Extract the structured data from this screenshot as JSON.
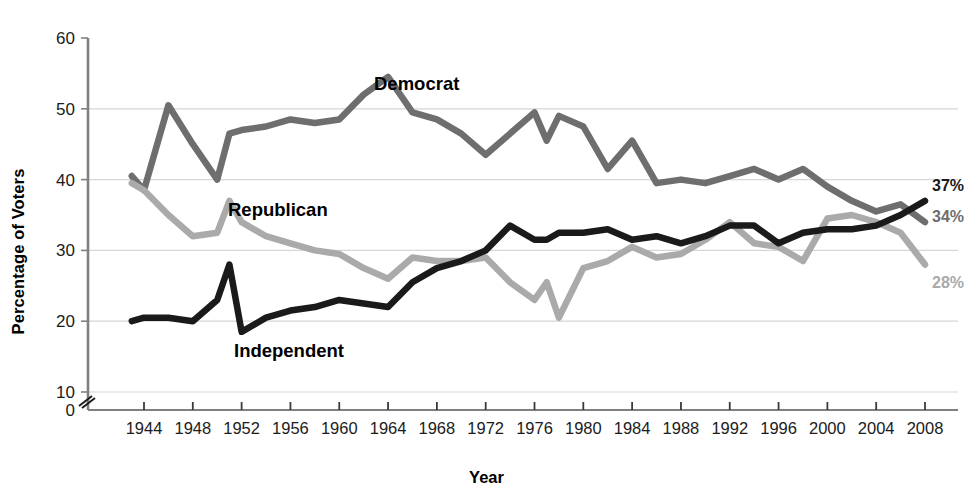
{
  "axis": {
    "ylabel": "Percentage of Voters",
    "xlabel": "Year",
    "y_ticks": [
      "0",
      "10",
      "20",
      "30",
      "40",
      "50",
      "60"
    ],
    "x_ticks": [
      "1944",
      "1948",
      "1952",
      "1956",
      "1960",
      "1964",
      "1968",
      "1972",
      "1976",
      "1980",
      "1984",
      "1988",
      "1992",
      "1996",
      "2000",
      "2004",
      "2008"
    ],
    "axis_break": "axis-break-marker"
  },
  "series_labels": {
    "democrat": "Democrat",
    "republican": "Republican",
    "independent": "Independent"
  },
  "end_labels": {
    "independent": "37%",
    "democrat": "34%",
    "republican": "28%"
  },
  "colors": {
    "democrat": "#6e6e6e",
    "republican": "#aaaaaa",
    "independent": "#1a1a1a",
    "grid": "#d6d6d6",
    "axis": "#808080",
    "text": "#1b1b1b"
  },
  "chart_data": {
    "type": "line",
    "title": "",
    "xlabel": "Year",
    "ylabel": "Percentage of Voters",
    "xlim": [
      1943,
      2009
    ],
    "ylim": [
      10,
      60
    ],
    "ytick_values": [
      0,
      10,
      20,
      30,
      40,
      50,
      60
    ],
    "grid": "horizontal",
    "legend": "inline-labels",
    "axis_break_below": 10,
    "x": [
      1943,
      1944,
      1946,
      1948,
      1950,
      1951,
      1952,
      1954,
      1956,
      1958,
      1960,
      1962,
      1964,
      1966,
      1968,
      1970,
      1972,
      1974,
      1976,
      1977,
      1978,
      1980,
      1982,
      1984,
      1986,
      1988,
      1990,
      1992,
      1994,
      1996,
      1998,
      2000,
      2002,
      2004,
      2006,
      2008
    ],
    "series": [
      {
        "name": "Democrat",
        "color": "#6e6e6e",
        "end_label": "34%",
        "values": [
          40.5,
          38.5,
          50.5,
          45.0,
          40.0,
          46.5,
          47.0,
          47.5,
          48.5,
          48.0,
          48.5,
          52.0,
          54.5,
          49.5,
          48.5,
          46.5,
          43.5,
          46.5,
          49.5,
          45.5,
          49.0,
          47.5,
          41.5,
          45.5,
          39.5,
          40.0,
          39.5,
          40.5,
          41.5,
          40.0,
          41.5,
          39.0,
          37.0,
          35.5,
          36.5,
          34.0
        ]
      },
      {
        "name": "Republican",
        "color": "#aaaaaa",
        "end_label": "28%",
        "values": [
          39.5,
          38.5,
          35.0,
          32.0,
          32.5,
          37.0,
          34.0,
          32.0,
          31.0,
          30.0,
          29.5,
          27.5,
          26.0,
          29.0,
          28.5,
          28.5,
          29.0,
          25.5,
          23.0,
          25.5,
          20.5,
          27.5,
          28.5,
          30.5,
          29.0,
          29.5,
          31.5,
          34.0,
          31.0,
          30.5,
          28.5,
          34.5,
          35.0,
          34.0,
          32.5,
          28.0
        ]
      },
      {
        "name": "Independent",
        "color": "#1a1a1a",
        "end_label": "37%",
        "values": [
          20.0,
          20.5,
          20.5,
          20.0,
          23.0,
          28.0,
          18.5,
          20.5,
          21.5,
          22.0,
          23.0,
          22.5,
          22.0,
          25.5,
          27.5,
          28.5,
          30.0,
          33.5,
          31.5,
          31.5,
          32.5,
          32.5,
          33.0,
          31.5,
          32.0,
          31.0,
          32.0,
          33.5,
          33.5,
          31.0,
          32.5,
          33.0,
          33.0,
          33.5,
          35.0,
          37.0
        ]
      }
    ]
  }
}
